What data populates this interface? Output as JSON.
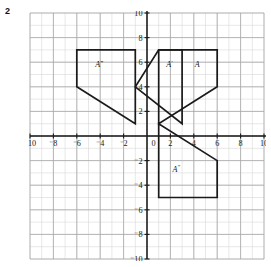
{
  "question": {
    "number": "2"
  },
  "graph": {
    "axis_labels": {
      "x_axis_name": "x",
      "y_axis_name": "y"
    },
    "x_ticks": [
      {
        "value": -10,
        "label": "⁻10"
      },
      {
        "value": -8,
        "label": "⁻8"
      },
      {
        "value": -6,
        "label": "⁻6"
      },
      {
        "value": -4,
        "label": "⁻4"
      },
      {
        "value": -2,
        "label": "⁻2"
      },
      {
        "value": 0,
        "label": "0"
      },
      {
        "value": 2,
        "label": "2"
      },
      {
        "value": 4,
        "label": "4"
      },
      {
        "value": 6,
        "label": "6"
      },
      {
        "value": 8,
        "label": "8"
      },
      {
        "value": 10,
        "label": "10"
      }
    ],
    "y_ticks": [
      {
        "value": 10,
        "label": "10"
      },
      {
        "value": 8,
        "label": "8"
      },
      {
        "value": 6,
        "label": "6"
      },
      {
        "value": 4,
        "label": "4"
      },
      {
        "value": 2,
        "label": "2"
      },
      {
        "value": -2,
        "label": "⁻2"
      },
      {
        "value": -4,
        "label": "⁻4"
      },
      {
        "value": -6,
        "label": "⁻6"
      },
      {
        "value": -8,
        "label": "⁻8"
      },
      {
        "value": -10,
        "label": "⁻10"
      }
    ],
    "xlim": [
      -10,
      10
    ],
    "ylim": [
      -10,
      10
    ],
    "minor_grid_step": 1,
    "major_grid_step": 2,
    "colors": {
      "minor_grid": "#d6d6d6",
      "major_grid": "#a8a8a8",
      "axis": "#1a1a1a",
      "shape_stroke": "#1a1a1a"
    }
  },
  "shapes": [
    {
      "id": "shape-a",
      "label": "A",
      "label_prime": "",
      "label_position": {
        "x": 4.3,
        "y": 5.6
      },
      "vertices": [
        [
          1,
          7
        ],
        [
          6,
          7
        ],
        [
          6,
          4
        ],
        [
          1,
          1
        ]
      ]
    },
    {
      "id": "shape-a-prime",
      "label": "A",
      "label_prime": "′",
      "label_position": {
        "x": 1.9,
        "y": 5.6
      },
      "vertices": [
        [
          1,
          7
        ],
        [
          3,
          7
        ],
        [
          3,
          1
        ],
        [
          -1,
          4
        ]
      ]
    },
    {
      "id": "shape-a-double-prime",
      "label": "A",
      "label_prime": "″",
      "label_position": {
        "x": 2.5,
        "y": -2.9
      },
      "vertices": [
        [
          1,
          1
        ],
        [
          1,
          -5
        ],
        [
          6,
          -5
        ],
        [
          6,
          -2
        ]
      ]
    },
    {
      "id": "shape-a-triple-prime",
      "label": "A",
      "label_prime": "‴",
      "label_position": {
        "x": -4.1,
        "y": 5.6
      },
      "vertices": [
        [
          -6,
          7
        ],
        [
          -1,
          7
        ],
        [
          -1,
          1
        ],
        [
          -6,
          4
        ]
      ]
    }
  ]
}
